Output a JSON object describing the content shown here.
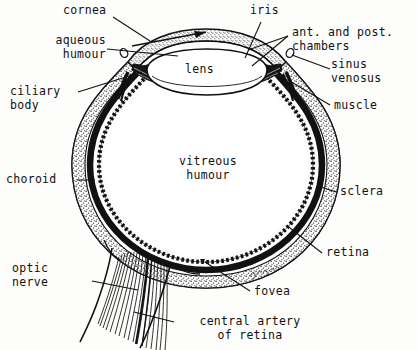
{
  "figure": {
    "type": "anatomical-diagram",
    "background_color": "#fdfdfb",
    "ink_color": "#111111",
    "artist_signature": "gnam"
  },
  "labels": {
    "cornea": "cornea",
    "aqueous_humour": "aqueous\nhumour",
    "ciliary_body": "ciliary\nbody",
    "choroid": "choroid",
    "optic_nerve": "optic\nnerve",
    "iris": "iris",
    "chambers": "ant. and post.\nchambers",
    "sinus_venosus": "sinus\nvenosus",
    "muscle": "muscle",
    "sclera": "sclera",
    "retina": "retina",
    "lens": "lens",
    "vitreous_humour": "vitreous\nhumour",
    "fovea": "fovea",
    "central_artery": "central artery\nof retina"
  },
  "structures": [
    {
      "name": "cornea",
      "side": "anterior-left"
    },
    {
      "name": "aqueous-humour",
      "side": "anterior"
    },
    {
      "name": "ciliary-body",
      "side": "anterior-left"
    },
    {
      "name": "iris",
      "side": "anterior"
    },
    {
      "name": "anterior-posterior-chambers",
      "side": "anterior"
    },
    {
      "name": "sinus-venosus",
      "side": "anterior-right"
    },
    {
      "name": "muscle",
      "side": "anterior-right"
    },
    {
      "name": "lens",
      "side": "central-anterior"
    },
    {
      "name": "vitreous-humour",
      "side": "central"
    },
    {
      "name": "sclera",
      "side": "outer-wall"
    },
    {
      "name": "choroid",
      "side": "middle-wall"
    },
    {
      "name": "retina",
      "side": "inner-wall"
    },
    {
      "name": "fovea",
      "side": "posterior"
    },
    {
      "name": "optic-nerve",
      "side": "posterior-inferior"
    },
    {
      "name": "central-artery-of-retina",
      "side": "posterior-inferior"
    }
  ]
}
